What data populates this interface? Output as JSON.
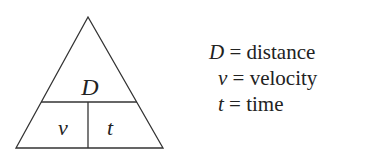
{
  "triangle": {
    "top_label": "D",
    "bottom_left_label": "v",
    "bottom_right_label": "t"
  },
  "legend": [
    {
      "symbol": "D",
      "equals": "=",
      "meaning": "distance"
    },
    {
      "symbol": "v",
      "equals": "=",
      "meaning": "velocity"
    },
    {
      "symbol": "t",
      "equals": "=",
      "meaning": "time"
    }
  ]
}
